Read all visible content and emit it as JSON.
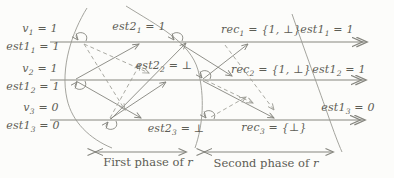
{
  "figure": {
    "colors": {
      "ink": "#5d5d55",
      "line": "#85857e",
      "dashed": "#a0a099"
    },
    "processes": [
      {
        "initial_top": {
          "var": "v",
          "sub": "1",
          "rest": " = 1"
        },
        "initial_bottom": {
          "var": "est1",
          "sub": "1",
          "rest": " = 1"
        },
        "phase1": {
          "var": "est2",
          "sub": "1",
          "rest": " = 1"
        },
        "phase2": {
          "var": "rec",
          "sub": "1",
          "rest": " = {1, ⊥}"
        },
        "end": {
          "var": "est1",
          "sub": "1",
          "rest": " = 1"
        }
      },
      {
        "initial_top": {
          "var": "v",
          "sub": "2",
          "rest": " = 1"
        },
        "initial_bottom": {
          "var": "est1",
          "sub": "2",
          "rest": " = 1"
        },
        "phase1": {
          "var": "est2",
          "sub": "2",
          "rest": " = ⊥"
        },
        "phase2": {
          "var": "rec",
          "sub": "2",
          "rest": " = {1, ⊥}"
        },
        "end": {
          "var": "est1",
          "sub": "2",
          "rest": " = 1"
        }
      },
      {
        "initial_top": {
          "var": "v",
          "sub": "3",
          "rest": " = 0"
        },
        "initial_bottom": {
          "var": "est1",
          "sub": "3",
          "rest": " = 0"
        },
        "phase1": {
          "var": "est2",
          "sub": "3",
          "rest": " = ⊥"
        },
        "phase2": {
          "var": "rec",
          "sub": "3",
          "rest": " = {⊥}"
        },
        "end": {
          "var": "est1",
          "sub": "3",
          "rest": " = 0"
        }
      }
    ],
    "phase_captions": [
      {
        "text": "First phase of ",
        "var": "r"
      },
      {
        "text": "Second phase of ",
        "var": "r"
      }
    ]
  }
}
